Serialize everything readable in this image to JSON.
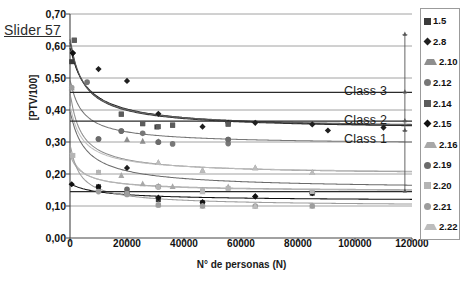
{
  "annotation": {
    "slider_label": "Slider 57"
  },
  "chart_data": {
    "type": "scatter",
    "title": "",
    "xlabel": "N° de personas (N)",
    "ylabel": "[PTV/100]",
    "xlim": [
      0,
      120000
    ],
    "ylim": [
      0.0,
      0.7
    ],
    "grid": true,
    "xticks": [
      0,
      20000,
      40000,
      60000,
      80000,
      100000,
      120000
    ],
    "xtick_labels": [
      "0",
      "20000",
      "40000",
      "60000",
      "80000",
      "100000",
      "120000"
    ],
    "yticks": [
      0.0,
      0.1,
      0.2,
      0.3,
      0.4,
      0.5,
      0.6,
      0.7
    ],
    "ytick_labels": [
      "0,00",
      "0,10",
      "0,20",
      "0,30",
      "0,40",
      "0,50",
      "0,60",
      "0,70"
    ],
    "legend_position": "right-outside",
    "annotations": [
      {
        "name": "class-3",
        "label": "Class 3",
        "y": 0.455,
        "x_text": 118000
      },
      {
        "name": "class-2",
        "label": "Class 2",
        "y": 0.365,
        "x_text": 118000
      },
      {
        "name": "class-1",
        "label": "Class 1",
        "y": 0.305,
        "x_text": 118000
      }
    ],
    "threshold_lines": [
      {
        "name": "class-3-threshold",
        "y": 0.455,
        "color": "#2b2b2b"
      },
      {
        "name": "class-2-threshold",
        "y": 0.365,
        "color": "#2b2b2b"
      },
      {
        "name": "class-1-threshold",
        "y": 0.145,
        "color": "#2b2b2b"
      }
    ],
    "range_bar": {
      "name": "range-indicator",
      "x": 117500,
      "y_min": 0.145,
      "y_max": 0.635,
      "ticks": [
        0.635,
        0.455,
        0.365,
        0.335,
        0.145
      ],
      "color": "#555555"
    },
    "series": [
      {
        "name": "1.5",
        "marker": "square",
        "color": "#3a3a3a",
        "points": [
          {
            "x": 600,
            "y": 0.551
          },
          {
            "x": 1500,
            "y": 0.618
          },
          {
            "x": 18000,
            "y": 0.387
          },
          {
            "x": 25500,
            "y": 0.357
          },
          {
            "x": 30500,
            "y": 0.347
          },
          {
            "x": 36000,
            "y": 0.353
          },
          {
            "x": 55500,
            "y": 0.356
          },
          {
            "x": 10000,
            "y": 0.16
          },
          {
            "x": 20000,
            "y": 0.14
          },
          {
            "x": 31000,
            "y": 0.12
          },
          {
            "x": 46500,
            "y": 0.11
          },
          {
            "x": 85000,
            "y": 0.14
          }
        ],
        "fit": {
          "kind": "power",
          "a": 0.62,
          "b": 0.11,
          "c": 0.335
        }
      },
      {
        "name": "2.8",
        "marker": "diamond",
        "color": "#1f1f1f",
        "points": [
          {
            "x": 1000,
            "y": 0.578
          },
          {
            "x": 10000,
            "y": 0.528
          },
          {
            "x": 20000,
            "y": 0.491
          },
          {
            "x": 31000,
            "y": 0.388
          },
          {
            "x": 46500,
            "y": 0.348
          },
          {
            "x": 55500,
            "y": 0.36
          },
          {
            "x": 65000,
            "y": 0.36
          },
          {
            "x": 85000,
            "y": 0.355
          },
          {
            "x": 90500,
            "y": 0.336
          },
          {
            "x": 110000,
            "y": 0.345
          },
          {
            "x": 20000,
            "y": 0.219
          },
          {
            "x": 65000,
            "y": 0.13
          }
        ],
        "fit": {
          "kind": "power",
          "a": 0.6,
          "b": 0.09,
          "c": 0.335
        }
      },
      {
        "name": "2.10",
        "marker": "triangle",
        "color": "#8e8e8e",
        "points": [
          {
            "x": 600,
            "y": 0.47
          },
          {
            "x": 20000,
            "y": 0.308
          },
          {
            "x": 25500,
            "y": 0.303
          },
          {
            "x": 31000,
            "y": 0.302
          },
          {
            "x": 31000,
            "y": 0.236
          },
          {
            "x": 46500,
            "y": 0.212
          },
          {
            "x": 65000,
            "y": 0.22
          },
          {
            "x": 85000,
            "y": 0.205
          }
        ],
        "fit": {
          "kind": "power",
          "a": 0.46,
          "b": 0.14,
          "c": 0.195
        }
      },
      {
        "name": "2.12",
        "marker": "circle",
        "color": "#777777",
        "points": [
          {
            "x": 6000,
            "y": 0.487
          },
          {
            "x": 18000,
            "y": 0.334
          },
          {
            "x": 25500,
            "y": 0.327
          },
          {
            "x": 31000,
            "y": 0.299
          },
          {
            "x": 36000,
            "y": 0.294
          },
          {
            "x": 55500,
            "y": 0.308
          },
          {
            "x": 55500,
            "y": 0.295
          },
          {
            "x": 10000,
            "y": 0.309
          }
        ],
        "fit": {
          "kind": "power",
          "a": 0.5,
          "b": 0.13,
          "c": 0.29
        }
      },
      {
        "name": "2.14",
        "marker": "square",
        "color": "#5c5c5c",
        "points": [
          {
            "x": 18000,
            "y": 0.387
          },
          {
            "x": 25500,
            "y": 0.358
          },
          {
            "x": 31000,
            "y": 0.348
          },
          {
            "x": 36000,
            "y": 0.352
          },
          {
            "x": 55500,
            "y": 0.356
          },
          {
            "x": 1500,
            "y": 0.618
          }
        ],
        "fit": {
          "kind": "power",
          "a": 0.63,
          "b": 0.12,
          "c": 0.34
        }
      },
      {
        "name": "2.15",
        "marker": "diamond",
        "color": "#111111",
        "points": [
          {
            "x": 1000,
            "y": 0.578
          },
          {
            "x": 600,
            "y": 0.168
          },
          {
            "x": 10000,
            "y": 0.16
          },
          {
            "x": 20000,
            "y": 0.14
          },
          {
            "x": 31000,
            "y": 0.126
          },
          {
            "x": 46500,
            "y": 0.112
          },
          {
            "x": 65000,
            "y": 0.13
          },
          {
            "x": 85000,
            "y": 0.14
          }
        ],
        "fit": {
          "kind": "power",
          "a": 0.17,
          "b": 0.05,
          "c": 0.115
        }
      },
      {
        "name": "2.16",
        "marker": "triangle",
        "color": "#a8a8a8",
        "points": [
          {
            "x": 10000,
            "y": 0.205
          },
          {
            "x": 18000,
            "y": 0.196
          },
          {
            "x": 25500,
            "y": 0.17
          },
          {
            "x": 31000,
            "y": 0.163
          },
          {
            "x": 36000,
            "y": 0.161
          },
          {
            "x": 46500,
            "y": 0.15
          },
          {
            "x": 55500,
            "y": 0.16
          },
          {
            "x": 31000,
            "y": 0.105
          },
          {
            "x": 46500,
            "y": 0.1
          },
          {
            "x": 65000,
            "y": 0.1
          },
          {
            "x": 85000,
            "y": 0.1
          }
        ],
        "fit": {
          "kind": "power",
          "a": 0.26,
          "b": 0.12,
          "c": 0.145
        }
      },
      {
        "name": "2.19",
        "marker": "circle",
        "color": "#6b6b6b",
        "points": [
          {
            "x": 10000,
            "y": 0.309
          },
          {
            "x": 18000,
            "y": 0.334
          },
          {
            "x": 20000,
            "y": 0.152
          },
          {
            "x": 31000,
            "y": 0.16
          },
          {
            "x": 31000,
            "y": 0.3
          },
          {
            "x": 55500,
            "y": 0.308
          }
        ],
        "fit": {
          "kind": "power",
          "a": 0.4,
          "b": 0.1,
          "c": 0.15
        }
      },
      {
        "name": "2.20",
        "marker": "square",
        "color": "#b5b5b5",
        "points": [
          {
            "x": 1000,
            "y": 0.258
          },
          {
            "x": 10000,
            "y": 0.205
          },
          {
            "x": 20000,
            "y": 0.138
          },
          {
            "x": 31000,
            "y": 0.16
          },
          {
            "x": 46500,
            "y": 0.148
          },
          {
            "x": 55500,
            "y": 0.155
          },
          {
            "x": 85000,
            "y": 0.145
          },
          {
            "x": 31000,
            "y": 0.103
          }
        ],
        "fit": {
          "kind": "power",
          "a": 0.27,
          "b": 0.13,
          "c": 0.143
        }
      },
      {
        "name": "2.21",
        "marker": "circle",
        "color": "#9d9d9d",
        "points": [
          {
            "x": 600,
            "y": 0.47
          },
          {
            "x": 10000,
            "y": 0.145
          },
          {
            "x": 20000,
            "y": 0.136
          },
          {
            "x": 31000,
            "y": 0.103
          },
          {
            "x": 46500,
            "y": 0.1
          },
          {
            "x": 65000,
            "y": 0.1
          },
          {
            "x": 85000,
            "y": 0.1
          }
        ],
        "fit": {
          "kind": "power",
          "a": 0.3,
          "b": 0.16,
          "c": 0.098
        }
      },
      {
        "name": "2.22",
        "marker": "triangle",
        "color": "#bdbdbd",
        "points": [
          {
            "x": 31000,
            "y": 0.236
          },
          {
            "x": 46500,
            "y": 0.212
          },
          {
            "x": 65000,
            "y": 0.22
          },
          {
            "x": 85000,
            "y": 0.205
          },
          {
            "x": 46500,
            "y": 0.145
          },
          {
            "x": 65000,
            "y": 0.1
          }
        ],
        "fit": {
          "kind": "power",
          "a": 0.42,
          "b": 0.13,
          "c": 0.198
        }
      }
    ]
  }
}
